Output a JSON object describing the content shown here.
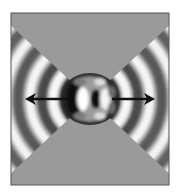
{
  "figure": {
    "type": "dipole-radiation-wave-pattern",
    "colors": {
      "background": "#ffffff",
      "field_gray": "#9a9a9a",
      "frame": "#555555",
      "crest": "#f4f4f4",
      "trough": "#1a1a1a",
      "trough_outer": "#5a5a5a",
      "arrow": "#111111"
    },
    "frame": {
      "x": 11,
      "y": 13,
      "width": 158,
      "height": 172
    },
    "center": {
      "x": 90,
      "y": 99
    },
    "arrows": [
      {
        "name": "left-arrow",
        "from_x": 72,
        "to_x": 25,
        "y": 99
      },
      {
        "name": "right-arrow",
        "from_x": 112,
        "to_x": 155,
        "y": 99
      }
    ]
  }
}
